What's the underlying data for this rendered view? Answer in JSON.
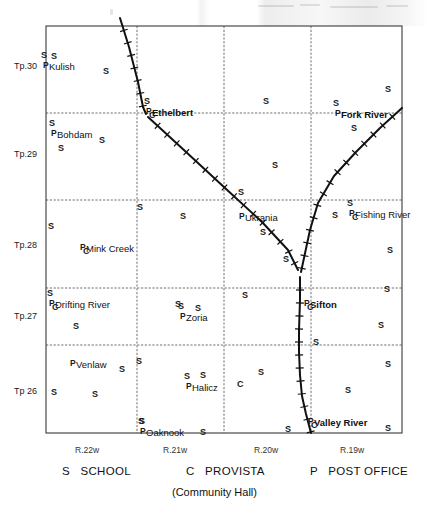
{
  "map": {
    "title": "Ethelbert district railway and settlement map",
    "frame": {
      "left": 46,
      "top": 26,
      "right": 402,
      "bottom": 433
    },
    "township_labels": [
      {
        "text": "Tp.30",
        "x": 14,
        "y": 62
      },
      {
        "text": "Tp.29",
        "x": 14,
        "y": 150
      },
      {
        "text": "Tp.28",
        "x": 14,
        "y": 241
      },
      {
        "text": "Tp.27",
        "x": 14,
        "y": 312
      },
      {
        "text": "Tp 26",
        "x": 14,
        "y": 387
      }
    ],
    "range_labels": [
      {
        "text": "R.22w",
        "x": 75,
        "y": 446
      },
      {
        "text": "R.21w",
        "x": 163,
        "y": 446
      },
      {
        "text": "R.20w",
        "x": 254,
        "y": 446
      },
      {
        "text": "R.19w",
        "x": 340,
        "y": 446
      }
    ],
    "grid": {
      "vertical_x": [
        46,
        137,
        224,
        311,
        402
      ],
      "horizontal_y": [
        26,
        113,
        200,
        288,
        345,
        433
      ]
    },
    "places": [
      {
        "name": "Kulish",
        "x": 49,
        "y": 62,
        "bold": false,
        "school": true,
        "post_office": true,
        "provista": false
      },
      {
        "name": "Ethelbert",
        "x": 152,
        "y": 108,
        "bold": true,
        "school": true,
        "post_office": true,
        "provista": true
      },
      {
        "name": "Bohdam",
        "x": 57,
        "y": 130,
        "bold": false,
        "school": true,
        "post_office": true,
        "provista": false
      },
      {
        "name": "Fork River",
        "x": 341,
        "y": 110,
        "bold": true,
        "school": true,
        "post_office": true,
        "provista": false
      },
      {
        "name": "Ukrania",
        "x": 245,
        "y": 213,
        "bold": false,
        "school": false,
        "post_office": true,
        "provista": false
      },
      {
        "name": "Fishing River",
        "x": 355,
        "y": 210,
        "bold": false,
        "school": true,
        "post_office": true,
        "provista": true
      },
      {
        "name": "Mink Creek",
        "x": 86,
        "y": 244,
        "bold": false,
        "school": false,
        "post_office": true,
        "provista": true
      },
      {
        "name": "Drifting River",
        "x": 55,
        "y": 300,
        "bold": false,
        "school": true,
        "post_office": true,
        "provista": true
      },
      {
        "name": "Sifton",
        "x": 310,
        "y": 300,
        "bold": true,
        "school": false,
        "post_office": true,
        "provista": true
      },
      {
        "name": "Zoria",
        "x": 186,
        "y": 313,
        "bold": false,
        "school": true,
        "post_office": true,
        "provista": false
      },
      {
        "name": "Venlaw",
        "x": 76,
        "y": 360,
        "bold": false,
        "school": false,
        "post_office": true,
        "provista": false
      },
      {
        "name": "Halicz",
        "x": 192,
        "y": 383,
        "bold": false,
        "school": true,
        "post_office": true,
        "provista": false
      },
      {
        "name": "Valley River",
        "x": 314,
        "y": 418,
        "bold": true,
        "school": false,
        "post_office": true,
        "provista": true
      },
      {
        "name": "Oaknook",
        "x": 146,
        "y": 428,
        "bold": false,
        "school": true,
        "post_office": true,
        "provista": false
      }
    ],
    "school_marks": [
      {
        "x": 51,
        "y": 52
      },
      {
        "x": 103,
        "y": 67
      },
      {
        "x": 263,
        "y": 97
      },
      {
        "x": 385,
        "y": 85
      },
      {
        "x": 351,
        "y": 124
      },
      {
        "x": 99,
        "y": 136
      },
      {
        "x": 58,
        "y": 144
      },
      {
        "x": 272,
        "y": 161
      },
      {
        "x": 137,
        "y": 203
      },
      {
        "x": 48,
        "y": 222
      },
      {
        "x": 180,
        "y": 212
      },
      {
        "x": 238,
        "y": 188
      },
      {
        "x": 332,
        "y": 211
      },
      {
        "x": 283,
        "y": 255
      },
      {
        "x": 260,
        "y": 228
      },
      {
        "x": 73,
        "y": 322
      },
      {
        "x": 175,
        "y": 300
      },
      {
        "x": 195,
        "y": 304
      },
      {
        "x": 242,
        "y": 291
      },
      {
        "x": 384,
        "y": 285
      },
      {
        "x": 387,
        "y": 246
      },
      {
        "x": 378,
        "y": 321
      },
      {
        "x": 313,
        "y": 338
      },
      {
        "x": 136,
        "y": 357
      },
      {
        "x": 119,
        "y": 365
      },
      {
        "x": 92,
        "y": 390
      },
      {
        "x": 51,
        "y": 388
      },
      {
        "x": 200,
        "y": 371
      },
      {
        "x": 258,
        "y": 368
      },
      {
        "x": 345,
        "y": 386
      },
      {
        "x": 385,
        "y": 360
      },
      {
        "x": 139,
        "y": 417
      },
      {
        "x": 200,
        "y": 428
      },
      {
        "x": 285,
        "y": 425
      },
      {
        "x": 385,
        "y": 424
      }
    ],
    "provista_marks": [
      {
        "x": 237,
        "y": 380
      }
    ],
    "railways": [
      {
        "name": "north-branch",
        "points": "120,18 129,47 138,82 143,107 146,114"
      },
      {
        "name": "ethelbert-to-sifton-branch",
        "points": "148,117 185,151 225,188 262,222 288,250 298,270"
      },
      {
        "name": "fork-river-to-sifton-branch",
        "points": "402,108 380,128 356,152 334,176 318,203 310,230 304,258 301,272"
      },
      {
        "name": "sifton-to-valley-river-main",
        "points": "300,277 300,300 299,330 299,352 300,375 302,396 306,414 311,433"
      }
    ]
  },
  "legend": {
    "items": [
      {
        "symbol": "S",
        "label": "SCHOOL"
      },
      {
        "symbol": "C",
        "label": "PROVISTA"
      },
      {
        "symbol": "P",
        "label": "POST OFFICE"
      }
    ],
    "subtitle": "(Community Hall)"
  },
  "colors": {
    "ink": "#111111",
    "grid": "#6a6a6a",
    "frame": "#333333",
    "paper": "#ffffff"
  }
}
